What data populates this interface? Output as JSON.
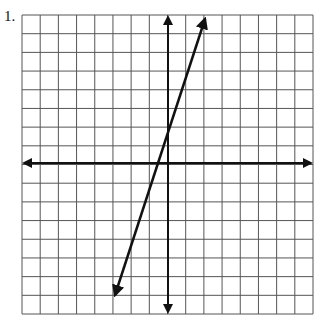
{
  "problem": {
    "number_label": "1."
  },
  "graph": {
    "grid": {
      "x_min": -8,
      "x_max": 8,
      "y_min": -8,
      "y_max": 8,
      "cells_x": 16,
      "cells_y": 16,
      "left_px": 22,
      "top_px": 15,
      "right_px": 313,
      "bottom_px": 314
    },
    "axes": {
      "x_axis": "horizontal line with arrows at both ends",
      "y_axis": "vertical line with arrows at both ends"
    },
    "line": {
      "slope": 3,
      "y_intercept": 2,
      "equation": "y = 3x + 2",
      "start_px": [
        113,
        300
      ],
      "end_px": [
        206,
        15
      ],
      "arrows": "both ends"
    },
    "colors": {
      "grid": "#555555",
      "axis": "#111111",
      "line": "#111111",
      "background": "#ffffff"
    }
  }
}
